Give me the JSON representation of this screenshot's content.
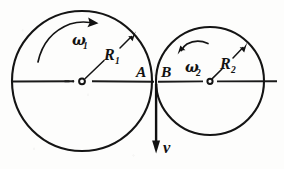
{
  "figure": {
    "kind": "physics-diagram",
    "background_color": "#fdfdfc",
    "ink_color": "#141414",
    "labels": {
      "omega_1": "ω",
      "omega_1_sub": "1",
      "omega_2": "ω",
      "omega_2_sub": "2",
      "radius_1": "R",
      "radius_1_sub": "1",
      "radius_2": "R",
      "radius_2_sub": "2",
      "point_a": "A",
      "point_b": "B",
      "velocity": "v"
    },
    "bodies": [
      {
        "id": "left-disc",
        "center_x": 82,
        "center_y": 81,
        "radius": 70,
        "radius_label": "R_1",
        "angular_velocity_label": "ω_1",
        "rotation_sense": "clockwise",
        "contact_point_label": "A"
      },
      {
        "id": "right-disc",
        "center_x": 210,
        "center_y": 81,
        "radius": 54,
        "radius_label": "R_2",
        "angular_velocity_label": "ω_2",
        "rotation_sense": "counterclockwise",
        "contact_point_label": "B"
      }
    ],
    "vectors": [
      {
        "id": "velocity-vector",
        "label": "v",
        "origin_x": 156,
        "origin_y": 84,
        "tip_x": 156,
        "tip_y": 152,
        "direction": "down"
      }
    ],
    "axis": {
      "id": "horizontal-centre-line",
      "x_start": 13,
      "x_end": 277,
      "y": 81
    },
    "contact": {
      "x": 156,
      "y": 82,
      "left_label": "A",
      "right_label": "B"
    }
  }
}
